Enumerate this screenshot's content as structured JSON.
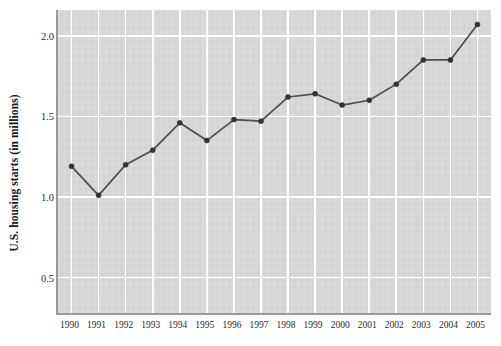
{
  "chart_data": {
    "type": "line",
    "title": "",
    "subtitle": "",
    "xlabel": "",
    "ylabel": "U.S. housing starts (in millions)",
    "categories": [
      "1990",
      "1991",
      "1992",
      "1993",
      "1994",
      "1995",
      "1996",
      "1997",
      "1998",
      "1999",
      "2000",
      "2001",
      "2002",
      "2003",
      "2004",
      "2005"
    ],
    "x": [
      1990,
      1991,
      1992,
      1993,
      1994,
      1995,
      1996,
      1997,
      1998,
      1999,
      2000,
      2001,
      2002,
      2003,
      2004,
      2005
    ],
    "values": [
      1.19,
      1.01,
      1.2,
      1.29,
      1.46,
      1.35,
      1.48,
      1.47,
      1.62,
      1.64,
      1.57,
      1.6,
      1.7,
      1.85,
      1.85,
      2.07
    ],
    "series": [
      {
        "name": "U.S. housing starts",
        "values": [
          1.19,
          1.01,
          1.2,
          1.29,
          1.46,
          1.35,
          1.48,
          1.47,
          1.62,
          1.64,
          1.57,
          1.6,
          1.7,
          1.85,
          1.85,
          2.07
        ]
      }
    ],
    "ylim": [
      0.28,
      2.16
    ],
    "xlim": [
      1989.5,
      2005.5
    ],
    "yticks": [
      0.5,
      1.0,
      1.5,
      2.0
    ],
    "ytick_labels": [
      "0.5",
      "1.0",
      "1.5",
      "2.0"
    ],
    "xticks": [
      1990,
      1991,
      1992,
      1993,
      1994,
      1995,
      1996,
      1997,
      1998,
      1999,
      2000,
      2001,
      2002,
      2003,
      2004,
      2005
    ],
    "grid": true,
    "grid_color": "#ffffff",
    "legend": null,
    "legend_position": "none",
    "annotations": [],
    "marker": "circle",
    "line_color": "#4d4d4d",
    "marker_color": "#333333",
    "plot_background": "#d7d7d7",
    "figure_background": "#ffffff",
    "axis_color": "#9a9a9a"
  }
}
